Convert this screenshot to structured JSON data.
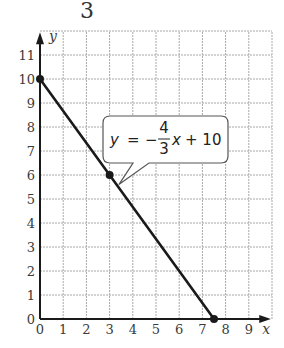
{
  "header_fragment": "3",
  "chart_data": {
    "type": "line",
    "title": "",
    "xlabel": "x",
    "ylabel": "y",
    "xlim": [
      0,
      10
    ],
    "ylim": [
      0,
      12
    ],
    "grid": true,
    "x_ticks": [
      "0",
      "1",
      "2",
      "3",
      "4",
      "5",
      "6",
      "7",
      "8",
      "9"
    ],
    "y_ticks": [
      "0",
      "1",
      "2",
      "3",
      "4",
      "5",
      "6",
      "7",
      "8",
      "9",
      "10",
      "11"
    ],
    "series": [
      {
        "name": "y = -4/3x + 10",
        "x": [
          0,
          3,
          7.5
        ],
        "y": [
          10,
          6,
          0
        ],
        "marked_points": [
          [
            0,
            10
          ],
          [
            3,
            6
          ],
          [
            7.5,
            0
          ]
        ]
      }
    ],
    "annotations": [
      {
        "text": "y = −4/3x + 10",
        "lhs": "y",
        "eq": "=",
        "sign": "−",
        "num": "4",
        "den": "3",
        "var": "x",
        "rest": "+ 10",
        "points_to": [
          3.4,
          5.6
        ]
      }
    ],
    "colors": {
      "line": "#1a1a1a",
      "grid": "#a8a8a8",
      "axis": "#1a1a1a"
    }
  }
}
